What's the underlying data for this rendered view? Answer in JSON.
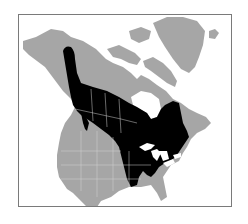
{
  "map": {
    "type": "range-map",
    "region": "North America",
    "colors": {
      "background": "#ffffff",
      "land": "#a6a6a6",
      "range": "#000000",
      "borders": "#d0d0d0",
      "water": "#ffffff",
      "frame": "#7a7a7a"
    },
    "legend": []
  }
}
